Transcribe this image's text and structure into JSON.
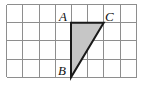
{
  "figure": {
    "canvas": {
      "width": 143,
      "height": 85,
      "background": "#ffffff"
    },
    "grid": {
      "columns": 8,
      "rows": 4,
      "cell_width": 16.2,
      "cell_height": 18.2,
      "origin_x": 6.5,
      "origin_y": 4.5,
      "line_color": "#8e8e8e",
      "outer_line_color": "#8e8e8e"
    },
    "shape": {
      "name": "triangle",
      "type": "right-triangle",
      "fill_color": "#c6c6c6",
      "stroke_color": "#1a1a1a",
      "stroke_width": 2,
      "points": "71,22.7 103.7,22.7 71,77.3",
      "vertices": [
        {
          "id": "A",
          "grid_col": 4,
          "grid_row": 1,
          "x": 71,
          "y": 22.7
        },
        {
          "id": "C",
          "grid_col": 6,
          "grid_row": 1,
          "x": 103.7,
          "y": 22.7
        },
        {
          "id": "B",
          "grid_col": 4,
          "grid_row": 4,
          "x": 71,
          "y": 77.3
        }
      ]
    },
    "labels": [
      {
        "id": "label-A",
        "text": "A",
        "x": 59,
        "y": 21
      },
      {
        "id": "label-C",
        "text": "C",
        "x": 105,
        "y": 21
      },
      {
        "id": "label-B",
        "text": "B",
        "x": 58,
        "y": 75
      }
    ]
  }
}
